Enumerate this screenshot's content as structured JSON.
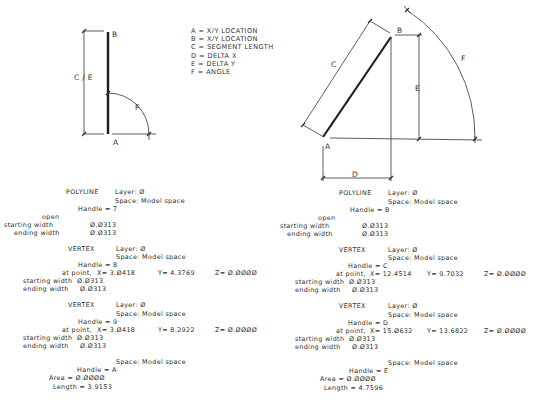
{
  "legend": {
    "items": [
      {
        "key": "A",
        "label": "X/Y LOCATION"
      },
      {
        "key": "B",
        "label": "X/Y LOCATION"
      },
      {
        "key": "C",
        "label": "SEGMENT LENGTH"
      },
      {
        "key": "D",
        "label": "DELTA X"
      },
      {
        "key": "E",
        "label": "DELTA Y"
      },
      {
        "key": "F",
        "label": "ANGLE"
      }
    ],
    "separator": "="
  },
  "left_diagram": {
    "labels": {
      "a": "A",
      "b": "B",
      "ce": "C / E",
      "f": "F"
    }
  },
  "right_diagram": {
    "labels": {
      "a": "A",
      "b": "B",
      "c": "C",
      "d": "D",
      "e": "E",
      "f": "F"
    }
  },
  "left_listing": {
    "polyline": {
      "title": "POLYLINE",
      "layer": "Layer: Ø",
      "space": "Space: Model space",
      "handle": "Handle = 7",
      "open": "open",
      "starting_width_label": "starting width",
      "starting_width": "Ø.Ø313",
      "ending_width_label": "ending width",
      "ending_width": "Ø.Ø313"
    },
    "vertices": [
      {
        "title": "VERTEX",
        "layer": "Layer: Ø",
        "space": "Space: Model space",
        "handle": "Handle = 8",
        "at_point": "at point,",
        "x": "X= 3.Ø418",
        "y": "Y= 4.3769",
        "z": "Z= Ø.ØØØØ",
        "starting_width_label": "starting width",
        "starting_width": "Ø.Ø313",
        "ending_width_label": "ending width",
        "ending_width": "Ø.Ø313"
      },
      {
        "title": "VERTEX",
        "layer": "Layer: Ø",
        "space": "Space: Model space",
        "handle": "Handle = 9",
        "at_point": "at point,",
        "x": "X= 3.Ø418",
        "y": "Y= 8.2922",
        "z": "Z= Ø.ØØØØ",
        "starting_width_label": "starting width",
        "starting_width": "Ø.Ø313",
        "ending_width_label": "ending width",
        "ending_width": "Ø.Ø313"
      }
    ],
    "seqend": {
      "space": "Space: Model space",
      "handle": "Handle = A",
      "area": "Area = Ø.ØØØØ",
      "length": "Length = 3.9153"
    }
  },
  "right_listing": {
    "polyline": {
      "title": "POLYLINE",
      "layer": "Layer: Ø",
      "space": "Space: Model space",
      "handle": "Handle = B",
      "open": "open",
      "starting_width_label": "starting width",
      "starting_width": "Ø.Ø313",
      "ending_width_label": "ending width",
      "ending_width": "Ø.Ø313"
    },
    "vertices": [
      {
        "title": "VERTEX",
        "layer": "Layer: Ø",
        "space": "Space: Model space",
        "handle": "Handle = C",
        "at_point": "at point,",
        "x": "X= 12.4514",
        "y": "Y= 9.7032",
        "z": "Z= Ø.ØØØØ",
        "starting_width_label": "starting width",
        "starting_width": "Ø.Ø313",
        "ending_width_label": "ending width",
        "ending_width": "Ø.Ø313"
      },
      {
        "title": "VERTEX",
        "layer": "Layer: Ø",
        "space": "Space: Model space",
        "handle": "Handle = D",
        "at_point": "at point,",
        "x": "X= 15.Ø632",
        "y": "Y= 13.6822",
        "z": "Z= Ø.ØØØØ",
        "starting_width_label": "starting width",
        "starting_width": "Ø.Ø313",
        "ending_width_label": "ending width",
        "ending_width": "Ø.Ø313"
      }
    ],
    "seqend": {
      "space": "Space: Model space",
      "handle": "Handle = E",
      "area": "Area = Ø.ØØØØ",
      "length": "Length = 4.7596"
    }
  }
}
